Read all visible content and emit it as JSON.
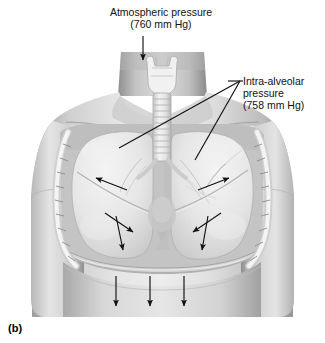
{
  "figure": {
    "panel_label": "(b)",
    "title_alt": "Thoracic cavity during inspiration"
  },
  "labels": {
    "atmospheric": {
      "line1": "Atmospheric pressure",
      "line2": "(760 mm Hg)",
      "value": 760,
      "unit": "mm Hg"
    },
    "intra_alveolar": {
      "line1": "Intra-alveolar",
      "line2": "pressure",
      "line3": "(758 mm Hg)",
      "value": 758,
      "unit": "mm Hg"
    }
  },
  "colors": {
    "background": "#ffffff",
    "ink": "#111111",
    "skin_light": "#e3e3e3",
    "skin_mid": "#c8c8c8",
    "skin_dark": "#9a9a9a",
    "lung_light": "#ededed",
    "lung_mid": "#d9d9d9",
    "bone": "#f2f2f2",
    "cavity_shadow": "#b4b4b4"
  },
  "annotations": {
    "atmospheric_arrow": "downward-arrow-into-larynx",
    "intra_alveolar_leaders": "two-leader-lines-to-left-and-right-lung",
    "lung_arrows": "four-inward-arrows-inside-lungs",
    "diaphragm_arrows": "three-downward-arrows-below-diaphragm"
  }
}
